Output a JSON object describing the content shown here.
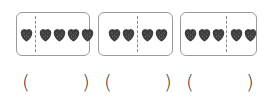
{
  "problems": [
    {
      "left_count": 1,
      "right_count": 4,
      "total": 5
    },
    {
      "left_count": 2,
      "right_count": 2,
      "total": 4
    },
    {
      "left_count": 3,
      "right_count": 2,
      "total": 5
    }
  ],
  "answers": [
    {
      "open": "(",
      "value": "",
      "close": ")"
    },
    {
      "open": "(",
      "value": "",
      "close": ")"
    },
    {
      "open": "(",
      "value": "",
      "close": ")"
    }
  ],
  "item_icon": "strawberry-icon",
  "colors": {
    "box_border": "#9a9a9a",
    "berry": "#3a3a3a",
    "text": "#333333"
  }
}
